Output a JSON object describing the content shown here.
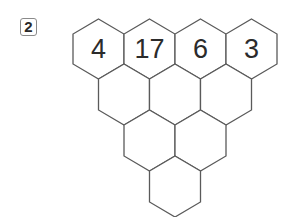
{
  "problem": {
    "number_label": "2"
  },
  "pyramid": {
    "rows": [
      [
        "4",
        "17",
        "6",
        "3"
      ],
      [
        "",
        "",
        ""
      ],
      [
        "",
        ""
      ],
      [
        ""
      ]
    ]
  }
}
